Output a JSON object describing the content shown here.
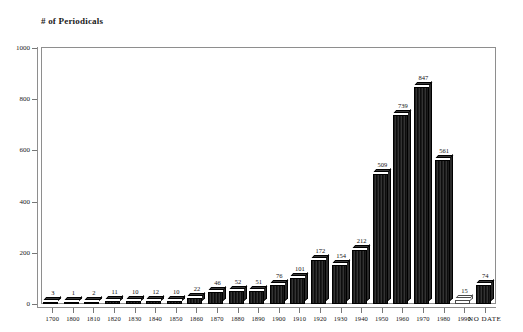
{
  "chart_data": {
    "type": "bar",
    "title": "# of Periodicals",
    "xlabel": "",
    "ylabel": "",
    "ylim": [
      0,
      1000
    ],
    "ytick_labels": [
      "0",
      "200",
      "400",
      "600",
      "800",
      "1000"
    ],
    "ytick_values": [
      0,
      200,
      400,
      600,
      800,
      1000
    ],
    "grid": false,
    "legend": null,
    "bar_color": "#171717",
    "frame_color": "#8e8e8e",
    "categories": [
      "1700",
      "1800",
      "1810",
      "1820",
      "1830",
      "1840",
      "1850",
      "1860",
      "1870",
      "1880",
      "1890",
      "1900",
      "1910",
      "1920",
      "1930",
      "1940",
      "1950",
      "1960",
      "1970",
      "1980",
      "1990",
      "NO DATE"
    ],
    "values": [
      3,
      1,
      2,
      11,
      10,
      12,
      10,
      22,
      46,
      52,
      51,
      76,
      101,
      172,
      154,
      212,
      509,
      739,
      847,
      561,
      15,
      74
    ],
    "data_labels": [
      "3",
      "1",
      "2",
      "11",
      "10",
      "12",
      "10",
      "22",
      "46",
      "52",
      "51",
      "76",
      "101",
      "172",
      "154",
      "212",
      "509",
      "739",
      "847",
      "561",
      "15",
      "74"
    ]
  }
}
